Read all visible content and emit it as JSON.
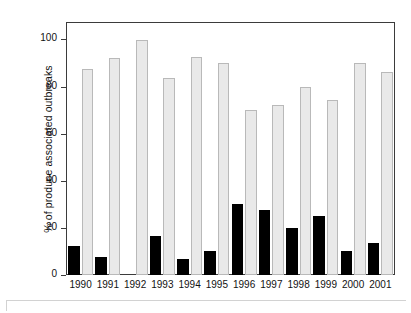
{
  "chart_data": {
    "type": "bar",
    "title": "",
    "subtitle": "",
    "xlabel": "",
    "ylabel": "% of produce associated outbreaks",
    "categories": [
      "1990",
      "1991",
      "1992",
      "1993",
      "1994",
      "1995",
      "1996",
      "1997",
      "1998",
      "1999",
      "2000",
      "2001"
    ],
    "series": [
      {
        "name": "black-series",
        "color": "#000000",
        "values": [
          12.5,
          7.5,
          0,
          16.5,
          6.7,
          10,
          30,
          27.5,
          20,
          25,
          10,
          13.5
        ]
      },
      {
        "name": "light-gray-series",
        "color": "#e9e9e9",
        "values": [
          87.5,
          92,
          100,
          83.5,
          92.5,
          90,
          70,
          72,
          80,
          74.5,
          90,
          86
        ]
      }
    ],
    "ylim": [
      0,
      107
    ],
    "yticks": [
      0,
      20,
      40,
      60,
      80,
      100
    ],
    "ytick_labels": [
      "0",
      "20",
      "40",
      "60",
      "80",
      "100"
    ],
    "xlim_note": "categorical, 12 year groups",
    "grid": false,
    "legend": "none",
    "frame": "full box border"
  },
  "axes": {
    "y_title": "% of produce associated outbreaks"
  }
}
